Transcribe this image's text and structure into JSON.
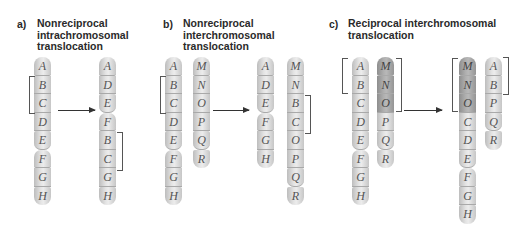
{
  "panels": [
    {
      "letter": "a)",
      "title_lines": [
        "Nonreciprocal",
        "intrachromosomal",
        "translocation"
      ],
      "before": [
        {
          "segments": [
            "A",
            "B",
            "C",
            "D",
            "E",
            "F",
            "G",
            "H"
          ],
          "centromere_after": "E",
          "shaded": []
        }
      ],
      "after": [
        {
          "segments": [
            "A",
            "D",
            "E",
            "F",
            "B",
            "C",
            "G",
            "H"
          ],
          "centromere_after": "E",
          "shaded": []
        }
      ],
      "brackets": [
        {
          "side": "left",
          "chromosome": "before-0",
          "segments": [
            "B",
            "C"
          ]
        },
        {
          "side": "right",
          "chromosome": "after-0",
          "segments": [
            "B",
            "C"
          ]
        }
      ]
    },
    {
      "letter": "b)",
      "title_lines": [
        "Nonreciprocal",
        "interchromosomal",
        "translocation"
      ],
      "before": [
        {
          "segments": [
            "A",
            "B",
            "C",
            "D",
            "E",
            "F",
            "G",
            "H"
          ],
          "centromere_after": "E",
          "shaded": []
        },
        {
          "segments": [
            "M",
            "N",
            "O",
            "P",
            "Q",
            "R"
          ],
          "centromere_after": "Q",
          "shaded": []
        }
      ],
      "after": [
        {
          "segments": [
            "A",
            "D",
            "E",
            "F",
            "G",
            "H"
          ],
          "centromere_after": "E",
          "shaded": []
        },
        {
          "segments": [
            "M",
            "N",
            "B",
            "C",
            "O",
            "P",
            "Q",
            "R"
          ],
          "centromere_after": "Q",
          "shaded": []
        }
      ],
      "brackets": [
        {
          "side": "left",
          "chromosome": "before-0",
          "segments": [
            "B",
            "C"
          ]
        },
        {
          "side": "right",
          "chromosome": "after-1",
          "segments": [
            "B",
            "C"
          ]
        }
      ]
    },
    {
      "letter": "c)",
      "title_lines": [
        "Reciprocal interchromosomal",
        "translocation"
      ],
      "before": [
        {
          "segments": [
            "A",
            "B",
            "C",
            "D",
            "E",
            "F",
            "G",
            "H"
          ],
          "centromere_after": "E",
          "shaded": []
        },
        {
          "segments": [
            "M",
            "N",
            "O",
            "P",
            "Q",
            "R"
          ],
          "centromere_after": "Q",
          "shaded": [
            "M",
            "N",
            "O"
          ]
        }
      ],
      "after": [
        {
          "segments": [
            "M",
            "N",
            "O",
            "C",
            "D",
            "E",
            "F",
            "G",
            "H"
          ],
          "centromere_after": "E",
          "shaded": [
            "M",
            "N",
            "O"
          ]
        },
        {
          "segments": [
            "A",
            "B",
            "P",
            "Q",
            "R"
          ],
          "centromere_after": "Q",
          "shaded": []
        }
      ],
      "brackets": [
        {
          "side": "left",
          "chromosome": "before-0",
          "segments": [
            "A",
            "B"
          ]
        },
        {
          "side": "right",
          "chromosome": "before-1",
          "segments": [
            "M",
            "N",
            "O"
          ]
        },
        {
          "side": "left",
          "chromosome": "after-0",
          "segments": [
            "M",
            "N",
            "O"
          ]
        },
        {
          "side": "right",
          "chromosome": "after-1",
          "segments": [
            "A",
            "B"
          ]
        }
      ]
    }
  ],
  "colors": {
    "chromosome_light": "#e4e4e4",
    "chromosome_dark": "#b0b0b0",
    "text": "#2a2a2a"
  }
}
